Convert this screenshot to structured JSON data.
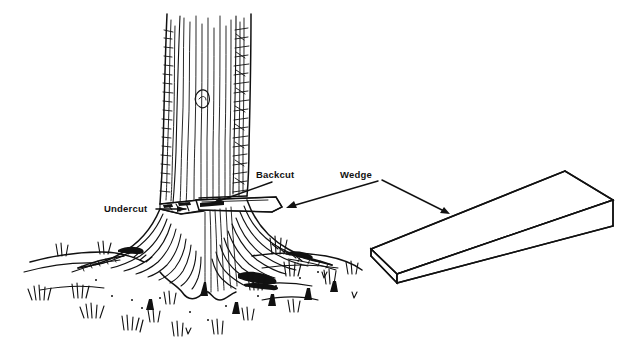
{
  "figure": {
    "background_color": "#ffffff",
    "ink_color": "#111111",
    "style": "black-and-white line drawing / pen-and-ink illustration",
    "width": 642,
    "height": 361
  },
  "labels": {
    "undercut": "Undercut",
    "backcut": "Backcut",
    "wedge": "Wedge"
  },
  "annotations": [
    {
      "id": "undercut",
      "text": "Undercut",
      "text_x": 104,
      "text_y": 212,
      "leader_from_x": 156,
      "leader_from_y": 209,
      "leader_to_x": 186,
      "leader_to_y": 209,
      "arrow": "right"
    },
    {
      "id": "backcut",
      "text": "Backcut",
      "text_x": 256,
      "text_y": 178,
      "leader_from_x": 268,
      "leader_from_y": 182,
      "leader_to_x": 214,
      "leader_to_y": 203,
      "arrow": "down-left"
    },
    {
      "id": "wedge",
      "text": "Wedge",
      "text_x": 340,
      "text_y": 178,
      "leader_from_x": 386,
      "leader_from_y": 181,
      "leader_to_x": 290,
      "leader_to_y": 205,
      "arrow": "down-left",
      "second_leader_from_x": 382,
      "second_leader_from_y": 180,
      "second_leader_to_x": 448,
      "second_leader_to_y": 213
    }
  ],
  "objects": {
    "tree": {
      "name": "standing tree trunk with flared root base",
      "trunk_left_x": 163,
      "trunk_right_x": 251,
      "trunk_top_y": 14,
      "base_y": 300,
      "texture": "vertical wavy bark striations"
    },
    "ground": {
      "name": "grassy ground line with scattered grass tufts",
      "y_range": [
        250,
        340
      ],
      "x_range": [
        18,
        372
      ]
    },
    "small_wedge": {
      "name": "felling wedge driven into backcut",
      "x_range": [
        193,
        282
      ],
      "y_range": [
        196,
        214
      ]
    },
    "large_wedge": {
      "name": "isometric detail view of felling wedge",
      "thin_end_x": 371,
      "thick_end_x": 613,
      "top_y": 171,
      "bottom_y": 285
    }
  }
}
